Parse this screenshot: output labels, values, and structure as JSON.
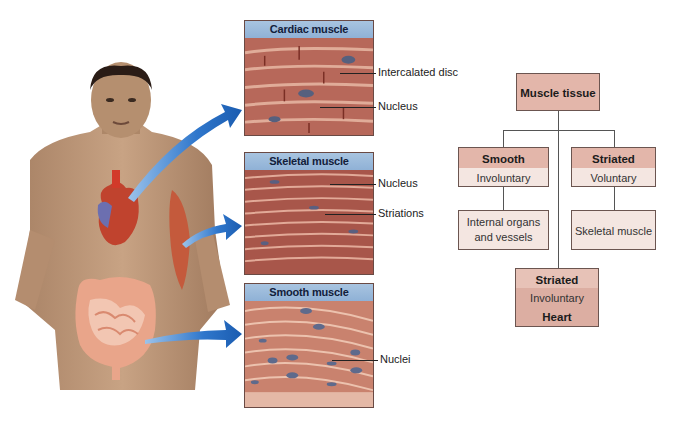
{
  "panels": [
    {
      "title": "Cardiac muscle",
      "labels": [
        "Intercalated disc",
        "Nucleus"
      ]
    },
    {
      "title": "Skeletal muscle",
      "labels": [
        "Nucleus",
        "Striations"
      ]
    },
    {
      "title": "Smooth muscle",
      "labels": [
        "Nuclei"
      ]
    }
  ],
  "flowchart": {
    "root": "Muscle tissue",
    "smooth": {
      "title": "Smooth",
      "sub": "Involuntary",
      "location": [
        "Internal organs",
        "and vessels"
      ]
    },
    "striated_voluntary": {
      "title": "Striated",
      "sub": "Voluntary",
      "location": "Skeletal muscle"
    },
    "striated_involuntary": {
      "title": "Striated",
      "sub": "Involuntary",
      "location": "Heart"
    }
  },
  "figure": {
    "organs": [
      "heart",
      "upper-arm muscle",
      "intestines"
    ]
  },
  "colors": {
    "arrow": "#2a6fc4",
    "panel_header": "#9dbbdc",
    "box_dark": "#e3b6aa",
    "box_light": "#f4e6e1"
  }
}
